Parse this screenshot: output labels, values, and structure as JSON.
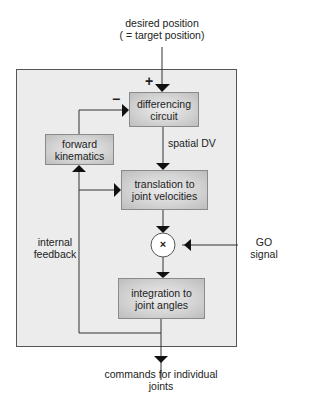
{
  "diagram": {
    "input_label": {
      "line1": "desired position",
      "line2": "( = target position)"
    },
    "output_label": {
      "line1": "commands for individual",
      "line2": "joints"
    },
    "go_label": {
      "line1": "GO",
      "line2": "signal"
    },
    "spatial_dv_label": "spatial DV",
    "feedback_label": {
      "line1": "internal",
      "line2": "feedback"
    },
    "plus_sign": "+",
    "minus_sign": "−",
    "multiply_sign": "×",
    "blocks": [
      {
        "id": "differencing-circuit",
        "line1": "differencing",
        "line2": "circuit"
      },
      {
        "id": "forward-kinematics",
        "line1": "forward",
        "line2": "kinematics"
      },
      {
        "id": "translation",
        "line1": "translation to",
        "line2": "joint velocities"
      },
      {
        "id": "integration",
        "line1": "integration to",
        "line2": "joint angles"
      }
    ],
    "colors": {
      "outer_fill": "#ececec",
      "outer_border": "#555555",
      "line": "#333333",
      "block_border": "#8a8a8a"
    }
  }
}
